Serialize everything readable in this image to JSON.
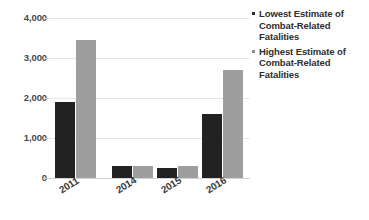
{
  "chart_data": {
    "type": "bar",
    "title": "",
    "subtitle": "",
    "xlabel": "",
    "ylabel": "",
    "categories": [
      "2011",
      "2014",
      "2015",
      "2016"
    ],
    "series": [
      {
        "name": "Lowest Estimate of Combat-Related Fatalities",
        "color": "#222222",
        "values": [
          1900,
          300,
          250,
          1600
        ]
      },
      {
        "name": "Highest Estimate of Combat-Related Fatalities",
        "color": "#9e9e9e",
        "values": [
          3450,
          290,
          300,
          2700
        ]
      }
    ],
    "ylim": [
      0,
      4000
    ],
    "ytick_values": [
      0,
      1000,
      2000,
      3000,
      4000
    ],
    "ytick_labels": [
      "0",
      "1,000",
      "2,000",
      "3,000",
      "4,000"
    ],
    "grid": true,
    "grid_axis": "y",
    "legend_position": "right",
    "xtick_rotation": -32
  },
  "axis": {
    "y": {
      "ticks": [
        {
          "label": "4,000",
          "value": 4000
        },
        {
          "label": "3,000",
          "value": 3000
        },
        {
          "label": "2,000",
          "value": 2000
        },
        {
          "label": "1,000",
          "value": 1000
        },
        {
          "label": "0",
          "value": 0
        }
      ]
    },
    "x": {
      "ticks": [
        {
          "label": "2011"
        },
        {
          "label": "2014"
        },
        {
          "label": "2015"
        },
        {
          "label": "2016"
        }
      ]
    }
  },
  "legend": {
    "entries": [
      {
        "label": "Lowest Estimate of Combat-Related Fatalities",
        "marker_color": "#2b2b2b",
        "series": "low"
      },
      {
        "label": "Highest Estimate of Combat-Related Fatalities",
        "marker_color": "#8d8d8d",
        "series": "high"
      }
    ]
  },
  "colors": {
    "lowest_estimate": "#222222",
    "highest_estimate": "#9e9e9e",
    "gridline": "#e6e6e6",
    "baseline": "#d2d2d2",
    "text": "#3d3d3d",
    "background": "#ffffff"
  }
}
